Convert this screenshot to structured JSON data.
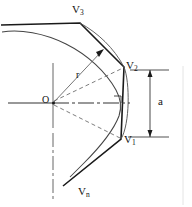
{
  "figure": {
    "background_color": "#ffffff",
    "stroke_color": "#1a1a1a",
    "thin_stroke_color": "#555555",
    "labels": {
      "origin": "O",
      "radius": "r",
      "dimension": "a",
      "vertex_1_base": "V",
      "vertex_1_sub": "1",
      "vertex_2_base": "V",
      "vertex_2_sub": "2",
      "vertex_3_base": "V",
      "vertex_3_sub": "3",
      "vertex_n_base": "V",
      "vertex_n_sub": "n"
    },
    "geometry": {
      "origin_x": 53,
      "origin_y": 103,
      "vertex_1": [
        121,
        139
      ],
      "vertex_2": [
        124,
        67
      ],
      "vertex_3": [
        80,
        23
      ],
      "arc_apex_x": 127,
      "chord_mid_y": 103,
      "dimension_line_x": 160,
      "dimension_top_y": 70,
      "dimension_bottom_y": 137,
      "right_angle_marker": [
        120,
        97
      ]
    },
    "elements": [
      "outer-arc",
      "inscribed-polygon",
      "radius-line",
      "dashed-radius-v1",
      "dashed-radius-v2",
      "horizontal-axis",
      "vertical-center-line",
      "dimension-line-a",
      "right-angle-marker"
    ]
  }
}
